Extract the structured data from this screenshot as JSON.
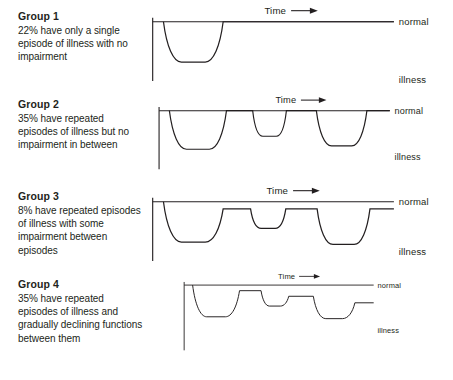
{
  "figure": {
    "axis_labels": {
      "normal": "normal",
      "illness": "illness",
      "time": "Time"
    },
    "arrow_icon": "right-arrow-icon"
  },
  "panels": [
    {
      "id": "group-1",
      "title": "Group 1",
      "description": "22% have only a single episode of illness with no impairment",
      "percent": "22%",
      "time_label": "Time",
      "normal_label": "normal",
      "illness_label": "illness"
    },
    {
      "id": "group-2",
      "title": "Group 2",
      "description": "35% have repeated episodes of illness but no impairment in between",
      "percent": "35%",
      "time_label": "Time",
      "normal_label": "normal",
      "illness_label": "illness"
    },
    {
      "id": "group-3",
      "title": "Group 3",
      "description": "8% have repeated episodes of illness with some impairment between episodes",
      "percent": "8%",
      "time_label": "Time",
      "normal_label": "normal",
      "illness_label": "illness"
    },
    {
      "id": "group-4",
      "title": "Group 4",
      "description": "35% have repeated episodes of illness and gradually declining functions between them",
      "percent": "35%",
      "time_label": "Time",
      "normal_label": "normal",
      "illness_label": "illness"
    }
  ],
  "chart_data": {
    "type": "line",
    "xlabel": "Time",
    "ylabel": "Level of functioning",
    "ytick_labels": [
      "normal",
      "illness"
    ],
    "grid": false,
    "legend": "none",
    "note": "y is level of functioning: 0 = normal baseline, negative = illness; x is arbitrary time units 0-250",
    "axis": {
      "x_origin": 5,
      "x_end": 250,
      "normal_y": 0,
      "baseline_stub_y": -62
    },
    "series": [
      {
        "name": "Group 1",
        "percent": 22,
        "baseline_after": 0,
        "episodes": [
          {
            "start": 11,
            "end": 72,
            "depth": -68,
            "recovery_level": 0
          }
        ]
      },
      {
        "name": "Group 2",
        "percent": 35,
        "baseline_after": 0,
        "episodes": [
          {
            "start": 11,
            "end": 72,
            "depth": -68,
            "recovery_level": 0
          },
          {
            "start": 100,
            "end": 136,
            "depth": -45,
            "recovery_level": 0
          },
          {
            "start": 168,
            "end": 222,
            "depth": -62,
            "recovery_level": 0
          }
        ]
      },
      {
        "name": "Group 3",
        "percent": 8,
        "baseline_after": -12,
        "episodes": [
          {
            "start": 11,
            "end": 72,
            "depth": -68,
            "recovery_level": -12
          },
          {
            "start": 100,
            "end": 136,
            "depth": -45,
            "recovery_level": -12
          },
          {
            "start": 168,
            "end": 222,
            "depth": -72,
            "recovery_level": -12
          }
        ]
      },
      {
        "name": "Group 4",
        "percent": 35,
        "baseline_after": -38,
        "episodes": [
          {
            "start": 11,
            "end": 72,
            "depth": -68,
            "recovery_level": -12
          },
          {
            "start": 100,
            "end": 136,
            "depth": -45,
            "recovery_level": -24
          },
          {
            "start": 168,
            "end": 222,
            "depth": -72,
            "recovery_level": -38
          }
        ]
      }
    ]
  }
}
